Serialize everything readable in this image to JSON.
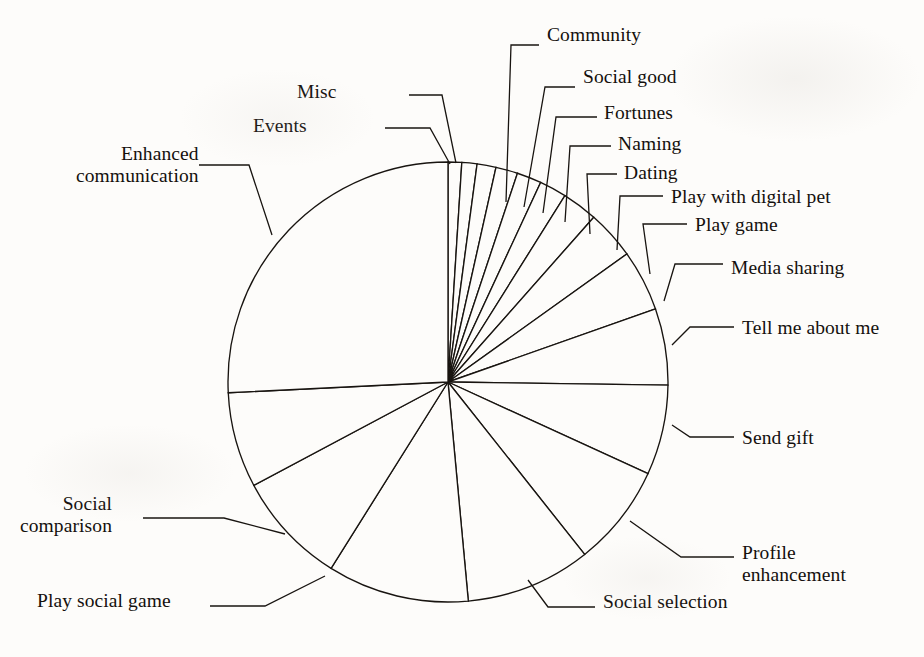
{
  "figure": {
    "background_color": "#fdfcfa",
    "ink_color": "#181410"
  },
  "chart_data": {
    "type": "pie",
    "title": "",
    "subtitle": "",
    "xlabel": "",
    "ylabel": "",
    "legend_position": "none",
    "grid": false,
    "labels_placement": "outside-with-leader-lines",
    "start_angle_deg_from_12oclock": 0,
    "direction": "clockwise",
    "center": {
      "x": 448,
      "y": 382
    },
    "radius": 220,
    "categories": [
      "Events",
      "Misc",
      "Community",
      "Social good",
      "Fortunes",
      "Naming",
      "Dating",
      "Play with digital pet",
      "Play game",
      "Media sharing",
      "Tell me about me",
      "Send gift",
      "Profile enhancement",
      "Social selection",
      "Play social game",
      "Social comparison",
      "Enhanced communication"
    ],
    "values": [
      1.0,
      1.1,
      1.4,
      1.6,
      1.8,
      2.0,
      2.6,
      3.6,
      4.5,
      5.6,
      6.6,
      7.5,
      9.2,
      10.4,
      8.3,
      7.0,
      25.8
    ],
    "units": "percent",
    "slices": [
      {
        "label": "Events",
        "value": 1.0,
        "start_deg": 0.0,
        "end_deg": 3.6
      },
      {
        "label": "Misc",
        "value": 1.1,
        "start_deg": 3.6,
        "end_deg": 7.6
      },
      {
        "label": "Community",
        "value": 1.4,
        "start_deg": 7.6,
        "end_deg": 12.6
      },
      {
        "label": "Social good",
        "value": 1.6,
        "start_deg": 12.6,
        "end_deg": 18.4
      },
      {
        "label": "Fortunes",
        "value": 1.8,
        "start_deg": 18.4,
        "end_deg": 24.9
      },
      {
        "label": "Naming",
        "value": 2.0,
        "start_deg": 24.9,
        "end_deg": 32.1
      },
      {
        "label": "Dating",
        "value": 2.6,
        "start_deg": 32.1,
        "end_deg": 41.5
      },
      {
        "label": "Play with digital pet",
        "value": 3.6,
        "start_deg": 41.5,
        "end_deg": 54.4
      },
      {
        "label": "Play game",
        "value": 4.5,
        "start_deg": 54.4,
        "end_deg": 70.6
      },
      {
        "label": "Media sharing",
        "value": 5.6,
        "start_deg": 70.6,
        "end_deg": 90.8
      },
      {
        "label": "Tell me about me",
        "value": 6.6,
        "start_deg": 90.8,
        "end_deg": 114.6
      },
      {
        "label": "Send gift",
        "value": 7.5,
        "start_deg": 114.6,
        "end_deg": 141.6
      },
      {
        "label": "Profile enhancement",
        "value": 9.2,
        "start_deg": 141.6,
        "end_deg": 174.7
      },
      {
        "label": "Social selection",
        "value": 10.4,
        "start_deg": 174.7,
        "end_deg": 212.1
      },
      {
        "label": "Play social game",
        "value": 8.3,
        "start_deg": 212.1,
        "end_deg": 242.0
      },
      {
        "label": "Social comparison",
        "value": 7.0,
        "start_deg": 242.0,
        "end_deg": 267.2
      },
      {
        "label": "Enhanced communication",
        "value": 25.8,
        "start_deg": 267.2,
        "end_deg": 360.0
      }
    ]
  },
  "labels": [
    {
      "name": "label-community",
      "text": "Community",
      "lines": [
        "Community"
      ],
      "align": "left",
      "x": 547,
      "y": 24,
      "leader": "M 506 202 L 511 45 L 539 45"
    },
    {
      "name": "label-social-good",
      "text": "Social good",
      "lines": [
        "Social good"
      ],
      "align": "left",
      "x": 583,
      "y": 66,
      "leader": "M 524 207 L 545 87 L 575 87"
    },
    {
      "name": "label-fortunes",
      "text": "Fortunes",
      "lines": [
        "Fortunes"
      ],
      "align": "left",
      "x": 604,
      "y": 102,
      "leader": "M 543 213 L 556 117 L 597 117"
    },
    {
      "name": "label-naming",
      "text": "Naming",
      "lines": [
        "Naming"
      ],
      "align": "left",
      "x": 618,
      "y": 133,
      "leader": "M 565 222 L 570 146 L 611 146"
    },
    {
      "name": "label-dating",
      "text": "Dating",
      "lines": [
        "Dating"
      ],
      "align": "left",
      "x": 624,
      "y": 162,
      "leader": "M 590 234 L 587 174 L 617 174"
    },
    {
      "name": "label-play-with-digital-pet",
      "text": "Play with digital pet",
      "lines": [
        "Play with digital pet"
      ],
      "align": "left",
      "x": 671,
      "y": 186,
      "leader": "M 617 250 L 620 196 L 663 196"
    },
    {
      "name": "label-play-game",
      "text": "Play game",
      "lines": [
        "Play game"
      ],
      "align": "left",
      "x": 695,
      "y": 214,
      "leader": "M 650 274 L 643 224 L 687 224"
    },
    {
      "name": "label-media-sharing",
      "text": "Media sharing",
      "lines": [
        "Media sharing"
      ],
      "align": "left",
      "x": 731,
      "y": 257,
      "leader": "M 664 301 L 675 264 L 723 264"
    },
    {
      "name": "label-tell-me-about-me",
      "text": "Tell me about me",
      "lines": [
        "Tell me about me"
      ],
      "align": "left",
      "x": 742,
      "y": 317,
      "leader": "M 672 345 L 690 327 L 734 327"
    },
    {
      "name": "label-send-gift",
      "text": "Send gift",
      "lines": [
        "Send gift"
      ],
      "align": "left",
      "x": 742,
      "y": 427,
      "leader": "M 672 425 L 690 437 L 734 437"
    },
    {
      "name": "label-profile-enhancement",
      "text": "Profile enhancement",
      "lines": [
        "Profile",
        "enhancement"
      ],
      "align": "left",
      "x": 742,
      "y": 542,
      "leader": "M 630 521 L 681 557 L 734 557"
    },
    {
      "name": "label-social-selection",
      "text": "Social selection",
      "lines": [
        "Social selection"
      ],
      "align": "left",
      "x": 603,
      "y": 591,
      "leader": "M 528 580 L 548 607 L 595 607"
    },
    {
      "name": "label-play-social-game",
      "text": "Play social game",
      "lines": [
        "Play social game"
      ],
      "align": "right",
      "x": 37,
      "y": 590,
      "leader": "M 325 576 L 265 606 L 210 606"
    },
    {
      "name": "label-social-comparison",
      "text": "Social comparison",
      "lines": [
        "Social",
        "comparison"
      ],
      "align": "right",
      "x": 20,
      "y": 493,
      "leader": "M 285 534 L 224 518 L 143 518"
    },
    {
      "name": "label-enhanced-communication",
      "text": "Enhanced communication",
      "lines": [
        "Enhanced",
        "communication"
      ],
      "align": "right",
      "x": 76,
      "y": 143,
      "leader": "M 272 235 L 249 165 L 199 165"
    },
    {
      "name": "label-misc",
      "text": "Misc",
      "lines": [
        "Misc"
      ],
      "align": "right",
      "x": 297,
      "y": 81,
      "leader": "M 456 163 L 442 95 L 409 95"
    },
    {
      "name": "label-events",
      "text": "Events",
      "lines": [
        "Events"
      ],
      "align": "right",
      "x": 253,
      "y": 115,
      "leader": "M 450 164 L 430 128 L 385 128"
    }
  ]
}
